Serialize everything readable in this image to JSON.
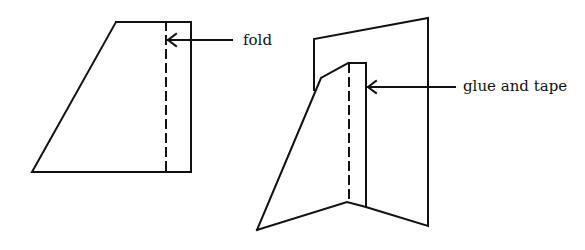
{
  "diagram": {
    "labels": {
      "fold": "fold",
      "glue_and_tape": "glue and tape"
    },
    "colors": {
      "stroke": "#111111",
      "background": "#ffffff"
    }
  }
}
